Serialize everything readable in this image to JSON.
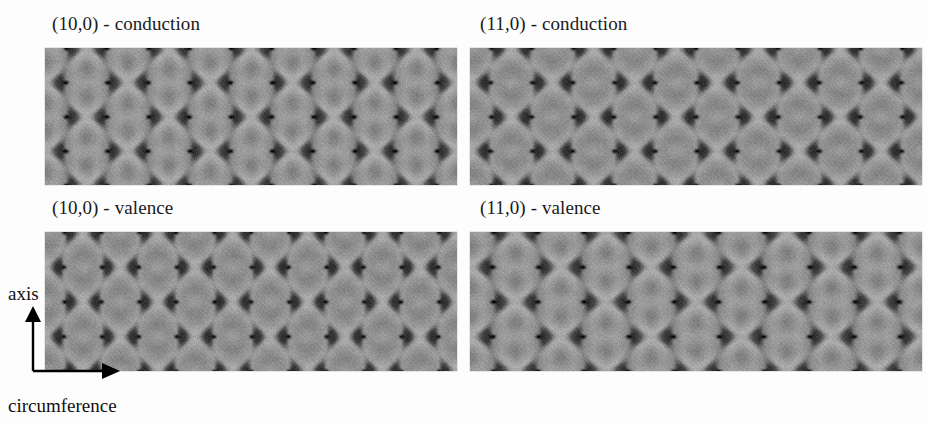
{
  "figure": {
    "background_color": "#fdfdfd",
    "width": 927,
    "height": 424
  },
  "panels": [
    {
      "id": "panel-10-0-conduction",
      "title": "(10,0) - conduction",
      "nanotube": "(10,0)",
      "band": "conduction",
      "pattern": "vertical-lobes",
      "x": 45,
      "y": 48,
      "w": 412,
      "h": 137,
      "title_x": 52,
      "title_y": 13
    },
    {
      "id": "panel-11-0-conduction",
      "title": "(11,0) - conduction",
      "nanotube": "(11,0)",
      "band": "conduction",
      "pattern": "horizontal-bands",
      "x": 470,
      "y": 48,
      "w": 452,
      "h": 137,
      "title_x": 480,
      "title_y": 13
    },
    {
      "id": "panel-10-0-valence",
      "title": "(10,0) - valence",
      "nanotube": "(10,0)",
      "band": "valence",
      "pattern": "horizontal-bands",
      "x": 45,
      "y": 232,
      "w": 412,
      "h": 139,
      "title_x": 52,
      "title_y": 197
    },
    {
      "id": "panel-11-0-valence",
      "title": "(11,0) - valence",
      "nanotube": "(11,0)",
      "band": "valence",
      "pattern": "vertical-lobes",
      "x": 470,
      "y": 232,
      "w": 452,
      "h": 139,
      "title_x": 480,
      "title_y": 197
    }
  ],
  "axes": {
    "vertical_label": "axis",
    "horizontal_label": "circumference",
    "vertical_label_x": 8,
    "vertical_label_y": 283,
    "horizontal_label_x": 8,
    "horizontal_label_y": 395,
    "corner_x": 33,
    "corner_y": 371,
    "arrow_up_tip_y": 306,
    "arrow_right_tip_x": 120,
    "line_color": "#000000"
  },
  "chart_data": {
    "type": "heatmap",
    "xlabel": "circumference",
    "ylabel": "axis",
    "colormap": "grayscale (dark = high density)",
    "legend": [],
    "grid": false,
    "panels": [
      {
        "label": "(10,0) - conduction",
        "lattice": "honeycomb",
        "lobe_orientation": "vertical (along tube axis)",
        "hex_columns": 10,
        "hex_rows": 4,
        "density_min": 0.08,
        "density_max": 1.0
      },
      {
        "label": "(11,0) - conduction",
        "lattice": "honeycomb",
        "lobe_orientation": "horizontal (along circumference)",
        "hex_columns": 11,
        "hex_rows": 4,
        "density_min": 0.08,
        "density_max": 1.0
      },
      {
        "label": "(10,0) - valence",
        "lattice": "honeycomb",
        "lobe_orientation": "horizontal (along circumference)",
        "hex_columns": 10,
        "hex_rows": 4,
        "density_min": 0.08,
        "density_max": 1.0
      },
      {
        "label": "(11,0) - valence",
        "lattice": "honeycomb",
        "lobe_orientation": "vertical (along tube axis)",
        "hex_columns": 11,
        "hex_rows": 4,
        "density_min": 0.08,
        "density_max": 1.0
      }
    ]
  }
}
